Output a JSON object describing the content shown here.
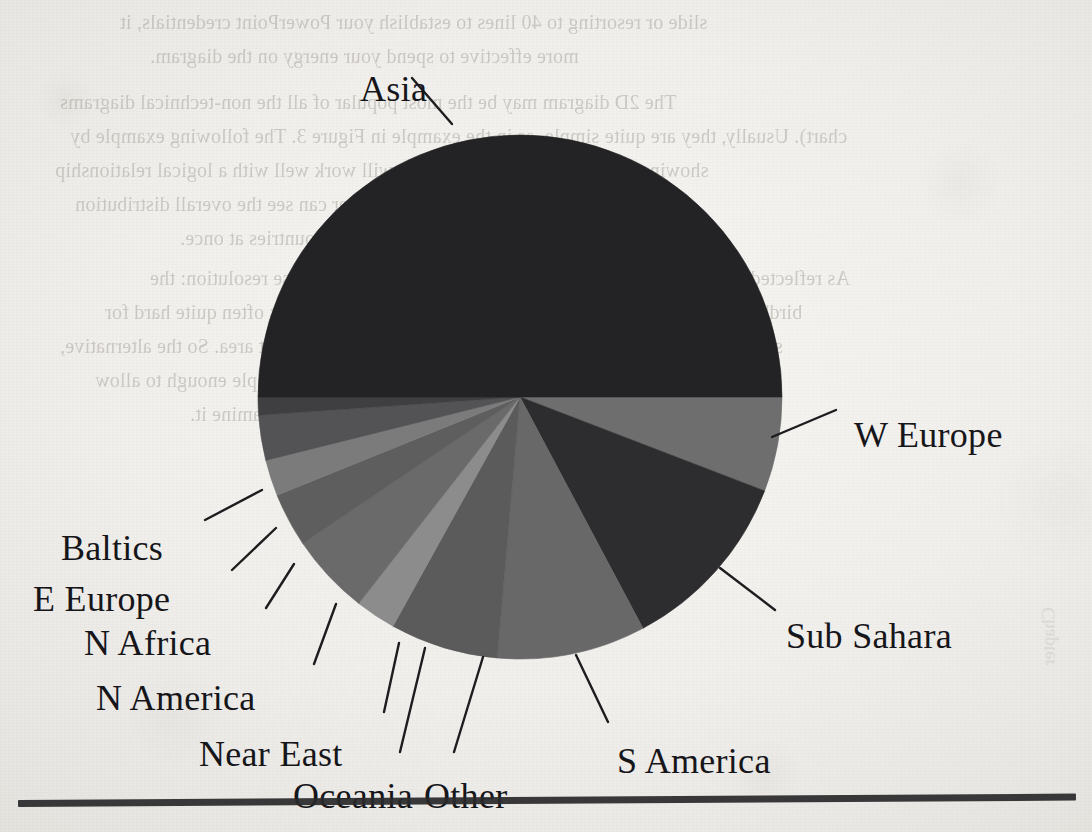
{
  "page": {
    "background_color": "#f1efec",
    "rule_color": "#2a2a2c"
  },
  "ghost_text": {
    "description": "faint mirrored show-through text from the reverse side of the scanned book page",
    "lines": [
      "slide or resorting to 40 lines to establish your PowerPoint credentials, it",
      "more effective to spend your energy on the diagram.",
      "The 2D diagram may be the most popular of all the non-technical diagrams",
      "chart). Usually, they are quite simple, as in the example in Figure 3. The following example by",
      "showing how the underlying pie chart will work well with a logical relationship",
      "which makes it work nicely and the reader can see the overall distribution",
      "across all countries at once.",
      "As reflected in the preceding text, there are two main ways to increase resolution: the",
      "bird's eye to handle the data, and the comparison of the data. It is often quite hard for",
      "several readers to look at a large amount of data in a small chart area. So the alternative,",
      "and possibly far better, is to keep the overall picture simple enough to allow",
      "the viewer to examine it."
    ]
  },
  "chart_data": {
    "type": "pie",
    "title": "",
    "legend_position": "callout-labels",
    "start_angle_deg": 0,
    "direction": "clockwise",
    "center": [
      520,
      397
    ],
    "radius": 262,
    "categories": [
      "W Europe",
      "Sub Sahara",
      "S America",
      "Other",
      "Oceania",
      "Near East",
      "N America",
      "N Africa",
      "E Europe",
      "Baltics",
      "Asia"
    ],
    "values": [
      5.8,
      11.4,
      9.2,
      6.7,
      2.5,
      5.0,
      3.3,
      2.2,
      2.8,
      1.1,
      50.0
    ],
    "unit": "percent",
    "slices": [
      {
        "label": "W Europe",
        "value": 5.8,
        "start_deg": 0,
        "end_deg": 21,
        "color": "#6e6e6e",
        "label_pos": [
          854,
          414
        ],
        "leader": [
          [
            772,
            437
          ],
          [
            836,
            410
          ]
        ]
      },
      {
        "label": "Sub Sahara",
        "value": 11.4,
        "start_deg": 21,
        "end_deg": 62,
        "color": "#2d2d2f",
        "label_pos": [
          786,
          615
        ],
        "leader": [
          [
            720,
            568
          ],
          [
            775,
            610
          ]
        ]
      },
      {
        "label": "S America",
        "value": 9.2,
        "start_deg": 62,
        "end_deg": 95,
        "color": "#686868",
        "label_pos": [
          617,
          740
        ],
        "leader": [
          [
            576,
            655
          ],
          [
            608,
            722
          ]
        ]
      },
      {
        "label": "Other",
        "value": 6.7,
        "start_deg": 95,
        "end_deg": 119,
        "color": "#5b5b5b",
        "label_pos": [
          424,
          775
        ],
        "leader": [
          [
            483,
            657
          ],
          [
            454,
            752
          ]
        ]
      },
      {
        "label": "Oceania",
        "value": 2.5,
        "start_deg": 119,
        "end_deg": 128,
        "color": "#8c8c8c",
        "label_pos": [
          293,
          775
        ],
        "leader": [
          [
            425,
            648
          ],
          [
            400,
            752
          ]
        ]
      },
      {
        "label": "Near East",
        "value": 5.0,
        "start_deg": 128,
        "end_deg": 146,
        "color": "#6a6a6a",
        "label_pos": [
          199,
          733
        ],
        "leader": [
          [
            399,
            643
          ],
          [
            384,
            712
          ]
        ]
      },
      {
        "label": "N America",
        "value": 3.3,
        "start_deg": 146,
        "end_deg": 158,
        "color": "#5e5e5e",
        "label_pos": [
          96,
          677
        ],
        "leader": [
          [
            336,
            604
          ],
          [
            314,
            664
          ]
        ]
      },
      {
        "label": "N Africa",
        "value": 2.2,
        "start_deg": 158,
        "end_deg": 166,
        "color": "#7b7b7b",
        "label_pos": [
          84,
          622
        ],
        "leader": [
          [
            294,
            564
          ],
          [
            266,
            608
          ]
        ]
      },
      {
        "label": "E Europe",
        "value": 2.8,
        "start_deg": 166,
        "end_deg": 176,
        "color": "#535355",
        "label_pos": [
          33,
          578
        ],
        "leader": [
          [
            276,
            528
          ],
          [
            232,
            570
          ]
        ]
      },
      {
        "label": "Baltics",
        "value": 1.1,
        "start_deg": 176,
        "end_deg": 180,
        "color": "#3f3f41",
        "label_pos": [
          61,
          527
        ],
        "leader": [
          [
            262,
            490
          ],
          [
            205,
            520
          ]
        ]
      },
      {
        "label": "Asia",
        "value": 50.0,
        "start_deg": 180,
        "end_deg": 360,
        "color": "#232325",
        "label_pos": [
          360,
          68
        ],
        "leader": [
          [
            452,
            124
          ],
          [
            412,
            78
          ]
        ]
      }
    ]
  },
  "labels": {
    "asia": "Asia",
    "w_europe": "W Europe",
    "sub_sahara": "Sub Sahara",
    "s_america": "S America",
    "other": "Other",
    "oceania": "Oceania",
    "near_east": "Near East",
    "n_america": "N America",
    "n_africa": "N Africa",
    "e_europe": "E Europe",
    "baltics": "Baltics"
  }
}
